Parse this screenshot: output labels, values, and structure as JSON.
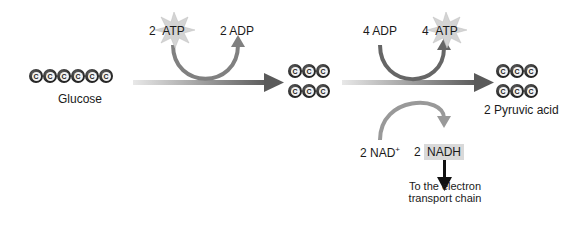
{
  "diagram": {
    "glucose": {
      "label": "Glucose",
      "carbons": [
        "C",
        "C",
        "C",
        "C",
        "C",
        "C"
      ]
    },
    "intermediate": {
      "rows": [
        [
          "C",
          "C",
          "C"
        ],
        [
          "C",
          "C",
          "C"
        ]
      ]
    },
    "pyruvate": {
      "label": "2 Pyruvic acid",
      "rows": [
        [
          "C",
          "C",
          "C"
        ],
        [
          "C",
          "C",
          "C"
        ]
      ]
    },
    "investment": {
      "atp_count": "2",
      "atp_label": "ATP",
      "adp_label": "2 ADP"
    },
    "payoff": {
      "adp_label": "4 ADP",
      "atp_count": "4",
      "atp_label": "ATP"
    },
    "redox": {
      "nad_label": "2 NAD",
      "nad_sup": "+",
      "nadh_count": "2",
      "nadh_label": "NADH"
    },
    "destination": {
      "line1": "To the electron",
      "line2": "transport chain"
    },
    "colors": {
      "carbon": "#2b2b2b",
      "arrow": "#666666",
      "curve": "#808080",
      "nadh_box": "#d9d9d9",
      "starburst": "#cfcfcf"
    }
  }
}
